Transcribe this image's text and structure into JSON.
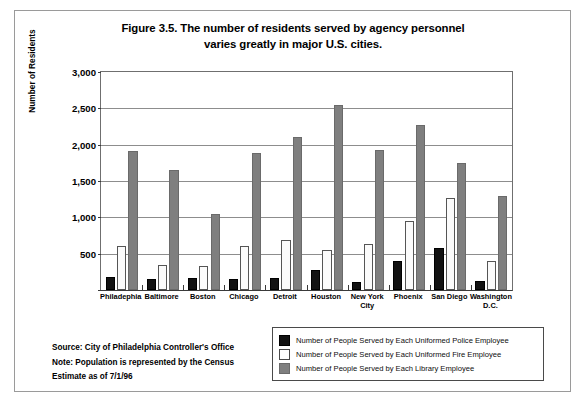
{
  "figure": {
    "title_line1": "Figure 3.5. The number of residents served by agency personnel",
    "title_line2": "varies greatly in major U.S. cities."
  },
  "notes": {
    "source": "Source: City of Philadelphia Controller's Office",
    "note": "Note: Population is represented by the Census",
    "estimate": "Estimate as of 7/1/96"
  },
  "chart_data": {
    "type": "bar",
    "title": "Figure 3.5. The number of residents served by agency personnel varies greatly in major U.S. cities.",
    "xlabel": "",
    "ylabel": "Number of Residents",
    "ylim": [
      0,
      3000
    ],
    "yticks": [
      0,
      500,
      1000,
      1500,
      2000,
      2500,
      3000
    ],
    "ytick_labels": [
      "",
      "500",
      "1,000",
      "1,500",
      "2,000",
      "2,500",
      "3,000"
    ],
    "grid": true,
    "legend_position": "bottom-right",
    "categories": [
      "Philadephia",
      "Baltimore",
      "Boston",
      "Chicago",
      "Detroit",
      "Houston",
      "New York City",
      "Phoenix",
      "San Diego",
      "Washington D.C."
    ],
    "category_display": [
      [
        "Philadephia"
      ],
      [
        "Baltimore"
      ],
      [
        "Boston"
      ],
      [
        "Chicago"
      ],
      [
        "Detroit"
      ],
      [
        "Houston"
      ],
      [
        "New York",
        "City"
      ],
      [
        "Phoenix"
      ],
      [
        "San Diego"
      ],
      [
        "Washington D.C."
      ]
    ],
    "series": [
      {
        "name": "Number of People Served by Each Uniformed Police Employee",
        "color": "#121212",
        "values": [
          185,
          150,
          165,
          155,
          170,
          280,
          110,
          400,
          580,
          130
        ]
      },
      {
        "name": "Number of People Served by Each Uniformed Fire Employee",
        "color": "#ffffff",
        "values": [
          605,
          350,
          330,
          605,
          690,
          545,
          630,
          950,
          1270,
          400
        ]
      },
      {
        "name": "Number of People Served by Each Library Employee",
        "color": "#7f7f7f",
        "values": [
          1910,
          1650,
          1040,
          1880,
          2100,
          2550,
          1920,
          2270,
          1750,
          1300
        ]
      }
    ]
  }
}
